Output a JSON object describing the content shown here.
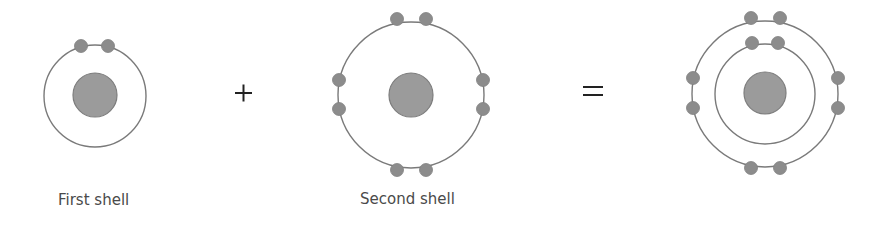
{
  "diagram": {
    "labels": {
      "first": "First shell",
      "second": "Second shell",
      "combined": ""
    },
    "operators": {
      "plus": "+",
      "equals": "="
    },
    "colors": {
      "shell_stroke": "#7a7a7a",
      "nucleus_fill": "#9b9b9b",
      "electron_fill": "#8c8c8c",
      "label_text": "#4a4a4a",
      "operator": "#222222"
    },
    "atoms": [
      {
        "name": "first-shell-atom",
        "electrons_per_shell": [
          2
        ]
      },
      {
        "name": "second-shell-atom",
        "electrons_per_shell": [
          8
        ]
      },
      {
        "name": "combined-atom",
        "electrons_per_shell": [
          2,
          8
        ]
      }
    ]
  }
}
